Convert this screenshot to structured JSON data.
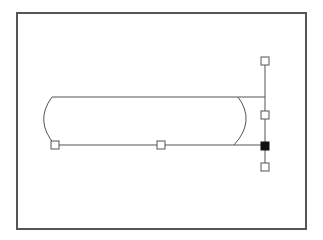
{
  "diagram": {
    "frame": {
      "x": 17,
      "y": 13,
      "width": 289,
      "height": 216,
      "stroke": "#555555"
    },
    "shape": {
      "type": "rounded-bar",
      "top_y": 97,
      "bottom_y": 145,
      "left_x": 51,
      "right_x": 240,
      "stroke": "#555555"
    },
    "guide_line": {
      "x": 265,
      "y1": 61,
      "y2": 167,
      "stroke": "#555555"
    },
    "handles": [
      {
        "name": "handle-bottom-left",
        "x": 55,
        "y": 145,
        "filled": false
      },
      {
        "name": "handle-bottom-middle",
        "x": 161,
        "y": 145,
        "filled": false
      },
      {
        "name": "handle-top",
        "x": 265,
        "y": 61,
        "filled": false
      },
      {
        "name": "handle-middle-right",
        "x": 265,
        "y": 115,
        "filled": false
      },
      {
        "name": "handle-anchor-selected",
        "x": 265,
        "y": 146,
        "filled": true
      },
      {
        "name": "handle-bottom",
        "x": 265,
        "y": 167,
        "filled": false
      }
    ],
    "colors": {
      "line": "#555555",
      "handle_fill_selected": "#111111",
      "background": "#ffffff"
    }
  }
}
